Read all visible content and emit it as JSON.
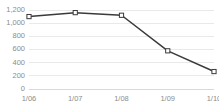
{
  "chart_data": {
    "type": "line",
    "title": "",
    "xlabel": "",
    "ylabel": "",
    "categories": [
      "1/06",
      "1/07",
      "1/08",
      "1/09",
      "1/10"
    ],
    "values": [
      1100,
      1160,
      1120,
      580,
      265
    ],
    "series": [
      {
        "name": "",
        "values": [
          1100,
          1160,
          1120,
          580,
          265
        ]
      }
    ],
    "ylim": [
      0,
      1200
    ],
    "ytick_values": [
      0,
      200,
      400,
      600,
      800,
      1000,
      1200
    ],
    "ytick_labels": [
      "0",
      "200",
      "400",
      "600",
      "800",
      "1,000",
      "1,200"
    ],
    "xtick_labels": [
      "1/06",
      "1/07",
      "1/08",
      "1/09",
      "1/10"
    ],
    "grid": true,
    "grid_axis": "y",
    "legend": false,
    "legend_position": "none",
    "marker": "square-open",
    "colors": {
      "line": "#3a3a3a",
      "marker_fill": "#ffffff",
      "marker_stroke": "#3a3a3a",
      "gridline": "#e4e4e4",
      "axis": "#d0d0d0",
      "tick_text": "#8c8c8c",
      "background": "#ffffff"
    }
  }
}
